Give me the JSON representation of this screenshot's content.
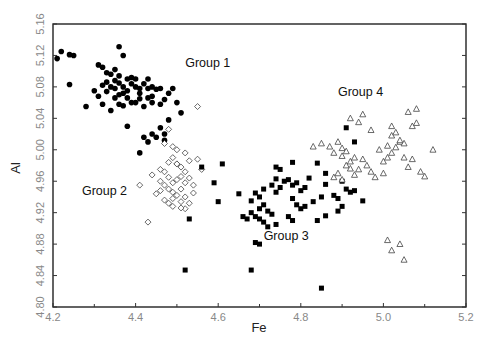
{
  "chart_data": {
    "type": "scatter",
    "title": "",
    "xlabel": "Fe",
    "ylabel": "Al",
    "xlim": [
      4.2,
      5.2
    ],
    "ylim": [
      4.8,
      5.16
    ],
    "xticks": [
      4.2,
      4.4,
      4.6,
      4.8,
      5.0,
      5.2
    ],
    "xtick_labels": [
      "4.2",
      "4.4",
      "4.6",
      "4.8",
      "5.0",
      "5.2"
    ],
    "yticks": [
      4.8,
      4.84,
      4.88,
      4.92,
      4.96,
      5.0,
      5.04,
      5.08,
      5.12,
      5.16
    ],
    "ytick_labels": [
      "4.80",
      "4.84",
      "4.88",
      "4.92",
      "4.96",
      "5.00",
      "5.04",
      "5.08",
      "5.12",
      "5.16"
    ],
    "grid": false,
    "legend": "none (groups annotated in plot)",
    "annotations": [
      {
        "text": "Group 1",
        "x": 4.52,
        "y": 5.105
      },
      {
        "text": "Group 2",
        "x": 4.27,
        "y": 4.942
      },
      {
        "text": "Group 3",
        "x": 4.71,
        "y": 4.885
      },
      {
        "text": "Group 4",
        "x": 4.89,
        "y": 5.068
      }
    ],
    "series": [
      {
        "name": "Group 1",
        "marker": "filled-circle",
        "points": [
          [
            4.22,
            5.125
          ],
          [
            4.24,
            5.121
          ],
          [
            4.25,
            5.12
          ],
          [
            4.21,
            5.116
          ],
          [
            4.24,
            5.083
          ],
          [
            4.28,
            5.055
          ],
          [
            4.31,
            5.108
          ],
          [
            4.32,
            5.105
          ],
          [
            4.33,
            5.098
          ],
          [
            4.34,
            5.096
          ],
          [
            4.35,
            5.102
          ],
          [
            4.36,
            5.094
          ],
          [
            4.36,
            5.131
          ],
          [
            4.37,
            5.12
          ],
          [
            4.35,
            5.088
          ],
          [
            4.33,
            5.086
          ],
          [
            4.32,
            5.082
          ],
          [
            4.34,
            5.08
          ],
          [
            4.35,
            5.078
          ],
          [
            4.36,
            5.085
          ],
          [
            4.37,
            5.08
          ],
          [
            4.38,
            5.09
          ],
          [
            4.39,
            5.092
          ],
          [
            4.39,
            5.084
          ],
          [
            4.38,
            5.075
          ],
          [
            4.37,
            5.072
          ],
          [
            4.36,
            5.07
          ],
          [
            4.38,
            5.066
          ],
          [
            4.4,
            5.08
          ],
          [
            4.41,
            5.078
          ],
          [
            4.42,
            5.084
          ],
          [
            4.43,
            5.078
          ],
          [
            4.44,
            5.08
          ],
          [
            4.45,
            5.077
          ],
          [
            4.44,
            5.068
          ],
          [
            4.43,
            5.066
          ],
          [
            4.41,
            5.065
          ],
          [
            4.4,
            5.06
          ],
          [
            4.39,
            5.06
          ],
          [
            4.37,
            5.056
          ],
          [
            4.36,
            5.058
          ],
          [
            4.34,
            5.05
          ],
          [
            4.32,
            5.058
          ],
          [
            4.4,
            5.09
          ],
          [
            4.35,
            5.066
          ],
          [
            4.42,
            5.055
          ],
          [
            4.46,
            5.078
          ],
          [
            4.47,
            5.064
          ],
          [
            4.46,
            5.058
          ],
          [
            4.44,
            5.06
          ],
          [
            4.48,
            5.072
          ],
          [
            4.49,
            5.078
          ],
          [
            4.5,
            5.06
          ],
          [
            4.3,
            5.075
          ],
          [
            4.31,
            5.068
          ],
          [
            4.33,
            5.074
          ],
          [
            4.41,
            5.072
          ],
          [
            4.43,
            5.09
          ],
          [
            4.42,
            5.016
          ],
          [
            4.44,
            5.02
          ],
          [
            4.45,
            5.016
          ],
          [
            4.43,
            5.01
          ],
          [
            4.41,
            4.996
          ],
          [
            4.47,
            5.012
          ],
          [
            4.38,
            5.03
          ],
          [
            4.46,
            5.028
          ],
          [
            4.47,
            5.02
          ],
          [
            4.51,
            5.047
          ],
          [
            4.48,
            5.038
          ]
        ]
      },
      {
        "name": "Group 2",
        "marker": "open-diamond",
        "points": [
          [
            4.55,
            5.055
          ],
          [
            4.48,
            5.026
          ],
          [
            4.47,
            5.008
          ],
          [
            4.49,
            5.004
          ],
          [
            4.5,
            5.0
          ],
          [
            4.52,
            4.996
          ],
          [
            4.49,
            4.99
          ],
          [
            4.48,
            4.984
          ],
          [
            4.5,
            4.982
          ],
          [
            4.51,
            4.978
          ],
          [
            4.53,
            4.986
          ],
          [
            4.52,
            4.972
          ],
          [
            4.51,
            4.966
          ],
          [
            4.5,
            4.962
          ],
          [
            4.49,
            4.958
          ],
          [
            4.48,
            4.965
          ],
          [
            4.47,
            4.972
          ],
          [
            4.46,
            4.96
          ],
          [
            4.47,
            4.955
          ],
          [
            4.46,
            4.948
          ],
          [
            4.48,
            4.95
          ],
          [
            4.49,
            4.946
          ],
          [
            4.5,
            4.942
          ],
          [
            4.51,
            4.95
          ],
          [
            4.52,
            4.958
          ],
          [
            4.53,
            4.964
          ],
          [
            4.54,
            4.955
          ],
          [
            4.52,
            4.94
          ],
          [
            4.51,
            4.934
          ],
          [
            4.49,
            4.928
          ],
          [
            4.47,
            4.936
          ],
          [
            4.45,
            4.944
          ],
          [
            4.44,
            4.968
          ],
          [
            4.52,
            4.925
          ],
          [
            4.53,
            4.932
          ],
          [
            4.43,
            4.908
          ],
          [
            4.41,
            4.955
          ],
          [
            4.5,
            4.982
          ],
          [
            4.46,
            4.975
          ],
          [
            4.49,
            4.938
          ],
          [
            4.51,
            4.926
          ],
          [
            4.54,
            4.945
          ],
          [
            4.55,
            4.988
          ],
          [
            4.56,
            4.975
          ],
          [
            4.48,
            4.932
          ]
        ]
      },
      {
        "name": "Group 3",
        "marker": "filled-square",
        "points": [
          [
            4.56,
            4.978
          ],
          [
            4.59,
            4.958
          ],
          [
            4.6,
            4.934
          ],
          [
            4.53,
            4.912
          ],
          [
            4.52,
            4.847
          ],
          [
            4.68,
            4.847
          ],
          [
            4.61,
            4.982
          ],
          [
            4.65,
            4.944
          ],
          [
            4.68,
            4.92
          ],
          [
            4.69,
            4.915
          ],
          [
            4.7,
            4.912
          ],
          [
            4.7,
            4.925
          ],
          [
            4.71,
            4.93
          ],
          [
            4.72,
            4.922
          ],
          [
            4.73,
            4.918
          ],
          [
            4.71,
            4.908
          ],
          [
            4.72,
            4.902
          ],
          [
            4.74,
            4.905
          ],
          [
            4.69,
            4.882
          ],
          [
            4.7,
            4.88
          ],
          [
            4.66,
            4.915
          ],
          [
            4.67,
            4.912
          ],
          [
            4.68,
            4.935
          ],
          [
            4.69,
            4.945
          ],
          [
            4.7,
            4.94
          ],
          [
            4.71,
            4.95
          ],
          [
            4.73,
            4.955
          ],
          [
            4.74,
            4.946
          ],
          [
            4.75,
            4.952
          ],
          [
            4.76,
            4.96
          ],
          [
            4.77,
            4.962
          ],
          [
            4.78,
            4.955
          ],
          [
            4.79,
            4.958
          ],
          [
            4.8,
            4.948
          ],
          [
            4.81,
            4.952
          ],
          [
            4.82,
            4.964
          ],
          [
            4.78,
            4.938
          ],
          [
            4.79,
            4.93
          ],
          [
            4.8,
            4.925
          ],
          [
            4.81,
            4.928
          ],
          [
            4.83,
            4.934
          ],
          [
            4.85,
            4.94
          ],
          [
            4.86,
            4.956
          ],
          [
            4.88,
            4.942
          ],
          [
            4.89,
            4.938
          ],
          [
            4.9,
            4.96
          ],
          [
            4.91,
            4.95
          ],
          [
            4.92,
            4.946
          ],
          [
            4.93,
            4.948
          ],
          [
            4.95,
            4.935
          ],
          [
            4.89,
            4.922
          ],
          [
            4.9,
            4.928
          ],
          [
            4.86,
            4.916
          ],
          [
            4.84,
            4.91
          ],
          [
            4.78,
            4.91
          ],
          [
            4.77,
            4.915
          ],
          [
            4.74,
            4.978
          ],
          [
            4.75,
            4.975
          ],
          [
            4.78,
            4.984
          ],
          [
            4.84,
            4.983
          ],
          [
            4.86,
            4.97
          ],
          [
            4.74,
            4.963
          ],
          [
            4.91,
            5.028
          ],
          [
            4.93,
            5.01
          ],
          [
            4.85,
            4.824
          ]
        ]
      },
      {
        "name": "Group 4",
        "marker": "open-triangle",
        "points": [
          [
            4.83,
            5.004
          ],
          [
            4.85,
            5.008
          ],
          [
            4.88,
            4.996
          ],
          [
            4.87,
            5.004
          ],
          [
            4.89,
            5.01
          ],
          [
            4.9,
            5.002
          ],
          [
            4.91,
            4.998
          ],
          [
            4.9,
            4.992
          ],
          [
            4.92,
            4.985
          ],
          [
            4.93,
            4.99
          ],
          [
            4.95,
            4.988
          ],
          [
            4.96,
            4.98
          ],
          [
            4.94,
            4.975
          ],
          [
            4.91,
            4.98
          ],
          [
            4.92,
            4.976
          ],
          [
            4.89,
            4.97
          ],
          [
            4.88,
            4.965
          ],
          [
            4.9,
            4.962
          ],
          [
            4.93,
            4.968
          ],
          [
            4.97,
            4.972
          ],
          [
            4.98,
            4.965
          ],
          [
            5.0,
            4.97
          ],
          [
            5.01,
            4.99
          ],
          [
            5.02,
            4.996
          ],
          [
            5.03,
            5.003
          ],
          [
            5.04,
            5.01
          ],
          [
            5.05,
            5.008
          ],
          [
            5.02,
            5.018
          ],
          [
            5.03,
            5.022
          ],
          [
            5.04,
            5.012
          ],
          [
            5.01,
            5.005
          ],
          [
            5.0,
            4.985
          ],
          [
            5.06,
            4.978
          ],
          [
            5.07,
            4.988
          ],
          [
            5.09,
            4.972
          ],
          [
            5.1,
            4.966
          ],
          [
            5.12,
            5.0
          ],
          [
            5.06,
            5.048
          ],
          [
            5.08,
            5.052
          ],
          [
            5.07,
            5.03
          ],
          [
            5.08,
            5.034
          ],
          [
            5.02,
            5.03
          ],
          [
            4.97,
            5.025
          ],
          [
            4.94,
            5.035
          ],
          [
            4.92,
            5.04
          ],
          [
            4.95,
            5.045
          ],
          [
            5.01,
            4.885
          ],
          [
            5.04,
            4.88
          ],
          [
            5.02,
            4.872
          ],
          [
            5.05,
            4.86
          ],
          [
            4.99,
            5.0
          ],
          [
            5.05,
            4.99
          ]
        ]
      }
    ]
  },
  "axes": {
    "x_title": "Fe",
    "y_title": "Al"
  }
}
